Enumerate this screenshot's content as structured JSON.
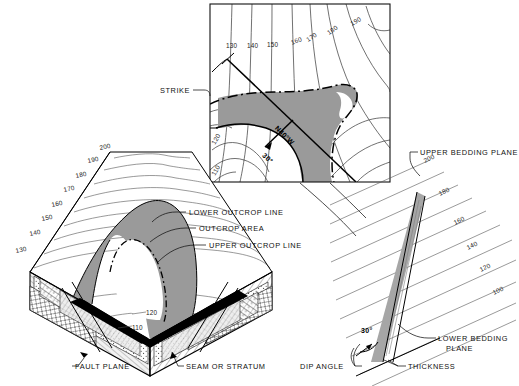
{
  "figure": {
    "colors": {
      "outcrop_gray": "#9a9a9a",
      "bed_gray": "#a6a6a6",
      "line_black": "#000000",
      "contour_gray": "#333333",
      "background": "#ffffff"
    }
  },
  "map_panel": {
    "name": "structure-contour-map",
    "contour_labels": [
      "130",
      "140",
      "150",
      "160",
      "170",
      "180",
      "190",
      "120",
      "110"
    ],
    "strike_bearing": "N40°W",
    "dip_value": "30°"
  },
  "block_panel": {
    "name": "block-diagram",
    "contour_labels": [
      "200",
      "190",
      "180",
      "170",
      "160",
      "150",
      "140",
      "130",
      "120",
      "110"
    ],
    "callouts": [
      {
        "key": "fault",
        "label": "FAULT PLANE"
      },
      {
        "key": "seam",
        "label": "SEAM OR STRATUM"
      }
    ]
  },
  "center_callouts": [
    {
      "key": "lower_outcrop",
      "label": "LOWER OUTCROP LINE"
    },
    {
      "key": "outcrop_area",
      "label": "OUTCROP AREA"
    },
    {
      "key": "upper_outcrop",
      "label": "UPPER OUTCROP LINE"
    },
    {
      "key": "strike",
      "label": "STRIKE"
    }
  ],
  "section_panel": {
    "name": "cross-section",
    "contour_labels": [
      "200",
      "180",
      "160",
      "140",
      "120",
      "100"
    ],
    "dip_value": "30°",
    "callouts": [
      {
        "key": "upper_bed",
        "label": "UPPER BEDDING PLANE"
      },
      {
        "key": "lower_bed",
        "label": "LOWER BEDDING"
      },
      {
        "key": "lower_bed2",
        "label": "PLANE"
      },
      {
        "key": "thickness",
        "label": "THICKNESS"
      },
      {
        "key": "dip_angle",
        "label": "DIP ANGLE"
      }
    ]
  }
}
